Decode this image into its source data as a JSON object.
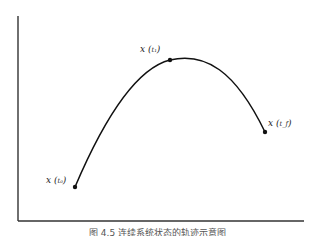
{
  "figure": {
    "type": "trajectory-sketch",
    "caption": "图 4.5  连续系统状态的轨迹示意图",
    "points": [
      {
        "id": "x_t0",
        "label_main": "x",
        "label_sub": "t₀",
        "role": "initial-state"
      },
      {
        "id": "x_t1",
        "label_main": "x",
        "label_sub": "t₁",
        "role": "intermediate-state"
      },
      {
        "id": "x_tf",
        "label_main": "x",
        "label_sub": "t_f",
        "role": "final-state"
      }
    ],
    "colors": {
      "curve": "#111111",
      "axis": "#333333"
    }
  }
}
